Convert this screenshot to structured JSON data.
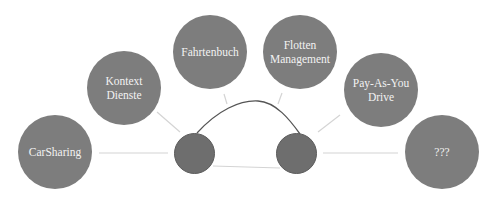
{
  "diagram": {
    "type": "car-centered concept map",
    "nodes": [
      {
        "id": "carsharing",
        "label": "CarSharing",
        "cx": 55,
        "cy": 152,
        "r": 37
      },
      {
        "id": "kontext",
        "label": "Kontext\nDienste",
        "cx": 124,
        "cy": 88,
        "r": 37
      },
      {
        "id": "fahrtenbuch",
        "label": "Fahrtenbuch",
        "cx": 210,
        "cy": 52,
        "r": 37
      },
      {
        "id": "flotten",
        "label": "Flotten\nManagement",
        "cx": 300,
        "cy": 52,
        "r": 37
      },
      {
        "id": "payd",
        "label": "Pay-As-You\nDrive",
        "cx": 381,
        "cy": 90,
        "r": 37
      },
      {
        "id": "unknown",
        "label": "???",
        "cx": 442,
        "cy": 152,
        "r": 37
      }
    ],
    "wheels": [
      {
        "id": "left-wheel",
        "cx": 194,
        "cy": 153,
        "r": 20
      },
      {
        "id": "right-wheel",
        "cx": 296,
        "cy": 153,
        "r": 20
      }
    ],
    "colors": {
      "bubble": "#7d7d7d",
      "wheel": "#6e6e6e",
      "connector": "#d4d4d4",
      "car_outline": "#555555",
      "text": "#f2f2f2"
    }
  }
}
